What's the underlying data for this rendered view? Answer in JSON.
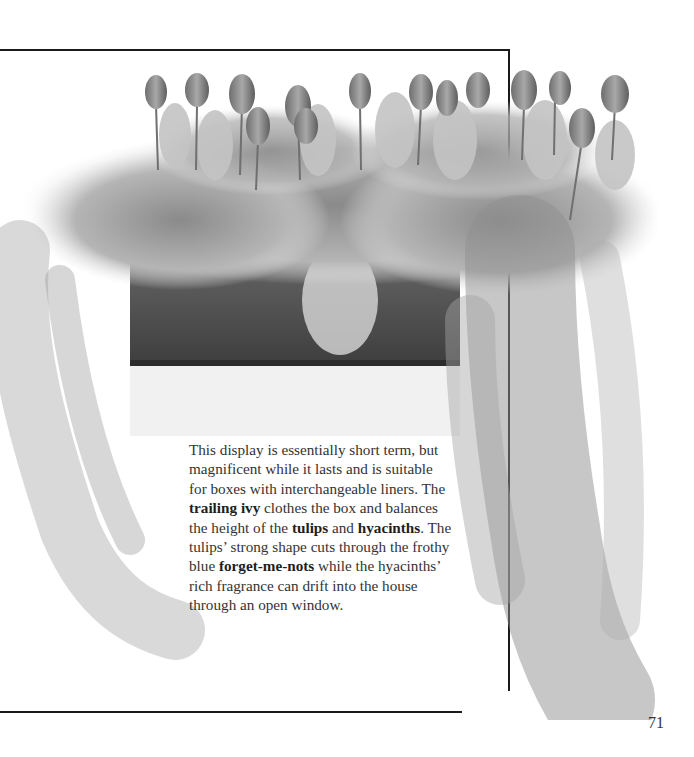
{
  "page": {
    "number": "71",
    "illustration": {
      "subject": "window box planting",
      "elements": [
        "tulips",
        "hyacinths",
        "forget-me-nots",
        "trailing ivy",
        "planter box"
      ]
    },
    "caption": {
      "segments": [
        {
          "text": "This display is essentially short term, but magnificent while it lasts and is suitable for boxes with interchangeable liners. The ",
          "bold": false
        },
        {
          "text": "trailing ivy",
          "bold": true
        },
        {
          "text": " clothes the box and balances the height of the ",
          "bold": false
        },
        {
          "text": "tulips",
          "bold": true
        },
        {
          "text": " and ",
          "bold": false
        },
        {
          "text": "hyacinths",
          "bold": true
        },
        {
          "text": ". The tulips’ strong shape cuts through the frothy blue ",
          "bold": false
        },
        {
          "text": "forget-me-nots",
          "bold": true
        },
        {
          "text": " while the hyacinths’ rich fragrance can drift into the house through an open window.",
          "bold": false
        }
      ]
    },
    "colors": {
      "rule": "#1a1a1a",
      "text": "#333333",
      "background": "#ffffff"
    }
  }
}
